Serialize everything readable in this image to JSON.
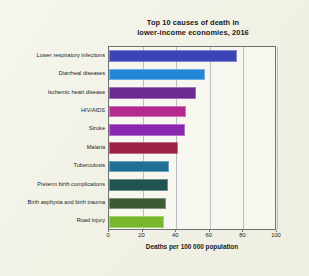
{
  "chart_data": {
    "type": "bar",
    "orientation": "horizontal",
    "title": "Top 10 causes of death in lower-income economies, 2016",
    "title_line1": "Top 10 causes of death in",
    "title_line2": "lower-income economies, 2016",
    "xlabel": "Deaths per 100 000 population",
    "ylabel": "",
    "xlim": [
      0,
      100
    ],
    "xticks": [
      0,
      20,
      40,
      60,
      80,
      100
    ],
    "xtick_labels": [
      "0",
      "20",
      "40",
      "60",
      "80",
      "100"
    ],
    "grid": true,
    "grid_axis": "x",
    "legend": false,
    "categories": [
      "Lower respiratory infections",
      "Diarrheal diseases",
      "Ischemic heart disease",
      "HIV/AIDS",
      "Stroke",
      "Malaria",
      "Tuberculosis",
      "Preterm birth complications",
      "Birth asphyxia and birth trauma",
      "Road injury"
    ],
    "values": [
      76,
      57,
      52,
      46,
      45,
      41,
      36,
      35,
      34,
      33
    ],
    "colors": [
      "#3b45b5",
      "#2486d8",
      "#6b2a91",
      "#b52a8e",
      "#8b28b0",
      "#9c1f46",
      "#1f6f96",
      "#1f5450",
      "#3c5b32",
      "#76b82a"
    ],
    "bars": [
      {
        "label": "Lower respiratory infections",
        "value": 76,
        "color": "#3b45b5"
      },
      {
        "label": "Diarrheal diseases",
        "value": 57,
        "color": "#2486d8"
      },
      {
        "label": "Ischemic heart disease",
        "value": 52,
        "color": "#6b2a91"
      },
      {
        "label": "HIV/AIDS",
        "value": 46,
        "color": "#b52a8e"
      },
      {
        "label": "Stroke",
        "value": 45,
        "color": "#8b28b0"
      },
      {
        "label": "Malaria",
        "value": 41,
        "color": "#9c1f46"
      },
      {
        "label": "Tuberculosis",
        "value": 36,
        "color": "#1f6f96"
      },
      {
        "label": "Preterm birth complications",
        "value": 35,
        "color": "#1f5450"
      },
      {
        "label": "Birth asphyxia and birth trauma",
        "value": 34,
        "color": "#3c5b32"
      },
      {
        "label": "Road injury",
        "value": 33,
        "color": "#76b82a"
      }
    ]
  },
  "figure": {
    "background_color": "#f3f3ea",
    "plot_background_color": "#f7f7ef",
    "axis_color": "#6f7070",
    "grid_color": "#b9bdc4",
    "text_color": "#1a1a22"
  }
}
